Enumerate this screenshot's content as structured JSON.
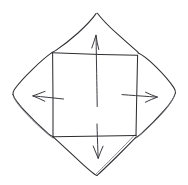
{
  "figure": {
    "style": "pencil-sketch",
    "background_color": "#ffffff",
    "ink_color": "#2e2e32",
    "secondary_ink_color": "#55555c",
    "arrow_color": "#3a3a40",
    "stroke_width": 1.05,
    "canvas": {
      "width": 188,
      "height": 185
    }
  },
  "shapes": {
    "outer_diamond": {
      "name": "rounded-diamond",
      "label": "outer folded flaps",
      "tips": {
        "top": {
          "x": 97,
          "y": 13
        },
        "right": {
          "x": 175,
          "y": 95
        },
        "bottom": {
          "x": 97,
          "y": 175
        },
        "left": {
          "x": 13,
          "y": 96
        }
      },
      "doubled_edges": [
        "left-bottom",
        "right-bottom"
      ]
    },
    "inner_square": {
      "name": "inscribed-square",
      "label": "central square panel",
      "corners": {
        "top_left": {
          "x": 52,
          "y": 52
        },
        "top_right": {
          "x": 137,
          "y": 55
        },
        "bottom_right": {
          "x": 136,
          "y": 135
        },
        "bottom_left": {
          "x": 53,
          "y": 136
        }
      }
    }
  },
  "arrows": [
    {
      "id": "arrow-up",
      "name": "fold-arrow-up",
      "direction": "up",
      "label": "",
      "tail": {
        "x": 97,
        "y": 106
      },
      "head": {
        "x": 96,
        "y": 35
      }
    },
    {
      "id": "arrow-right",
      "name": "fold-arrow-right",
      "direction": "right",
      "label": "",
      "tail": {
        "x": 122,
        "y": 95
      },
      "head": {
        "x": 157,
        "y": 97
      }
    },
    {
      "id": "arrow-down",
      "name": "fold-arrow-down",
      "direction": "down",
      "label": "",
      "tail": {
        "x": 97,
        "y": 124
      },
      "head": {
        "x": 98,
        "y": 158
      }
    },
    {
      "id": "arrow-left",
      "name": "fold-arrow-left",
      "direction": "left",
      "label": "",
      "tail": {
        "x": 63,
        "y": 99
      },
      "head": {
        "x": 33,
        "y": 96
      }
    }
  ]
}
